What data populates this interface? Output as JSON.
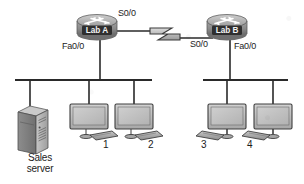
{
  "diagram": {
    "background_color": "#ffffff",
    "ink_color": "#1c1c1c",
    "device_fill": "#b9b9b9",
    "device_dark": "#4a4a4a",
    "screen_fill": "#c9c9c9"
  },
  "routers": [
    {
      "id": "router-lab-a",
      "name": "Lab A",
      "x": 97,
      "y": 26
    },
    {
      "id": "router-lab-b",
      "name": "Lab B",
      "x": 227,
      "y": 26
    }
  ],
  "interface_labels": {
    "lab_a_serial": "S0/0",
    "lab_b_serial": "S0/0",
    "lab_a_fastethernet": "Fa0/0",
    "lab_b_fastethernet": "Fa0/0"
  },
  "wan_link": {
    "type": "serial",
    "style": "lightning-bolt",
    "from": "Lab A",
    "to": "Lab B",
    "from_interface": "S0/0",
    "to_interface": "S0/0"
  },
  "segments": [
    {
      "id": "lan-left",
      "bar_x1": 15,
      "bar_x2": 152,
      "bar_y": 80,
      "router": "Lab A",
      "router_drop_x": 100
    },
    {
      "id": "lan-right",
      "bar_x1": 203,
      "bar_x2": 288,
      "bar_y": 80,
      "router": "Lab B",
      "router_drop_x": 230
    }
  ],
  "server": {
    "id": "sales-server",
    "label_line1": "Sales",
    "label_line2": "server",
    "drop_x": 30,
    "x": 40,
    "y": 122
  },
  "workstations": [
    {
      "id": "pc-1",
      "label": "1",
      "drop_x": 89,
      "x": 89,
      "y": 120,
      "keyboard_side": "right"
    },
    {
      "id": "pc-2",
      "label": "2",
      "drop_x": 134,
      "x": 134,
      "y": 120,
      "keyboard_side": "right"
    },
    {
      "id": "pc-3",
      "label": "3",
      "drop_x": 227,
      "x": 227,
      "y": 120,
      "keyboard_side": "left"
    },
    {
      "id": "pc-4",
      "label": "4",
      "drop_x": 273,
      "x": 273,
      "y": 120,
      "keyboard_side": "left"
    }
  ]
}
